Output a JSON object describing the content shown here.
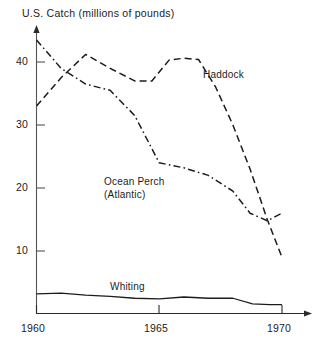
{
  "chart_data": {
    "type": "line",
    "title": "U.S. Catch (millions of pounds)",
    "xlabel": "",
    "ylabel": "U.S. Catch (millions of pounds)",
    "xlim": [
      1960,
      1970
    ],
    "ylim": [
      0,
      45
    ],
    "grid": false,
    "legend_position": "inline-annotations",
    "x_ticks": [
      "1960",
      "1965",
      "1970"
    ],
    "x_tick_values": [
      1960,
      1965,
      1970
    ],
    "y_ticks": [
      "10",
      "20",
      "30",
      "40"
    ],
    "y_tick_values": [
      10,
      20,
      30,
      40
    ],
    "series": [
      {
        "name": "Haddock",
        "style": "dashed",
        "color": "#1c1c1c",
        "x": [
          1960,
          1961,
          1962,
          1963,
          1964,
          1964.7,
          1965.4,
          1966,
          1966.6,
          1967.3,
          1968,
          1968.7,
          1969.4,
          1970
        ],
        "values": [
          33.0,
          37.5,
          41.2,
          39.0,
          37.0,
          37.0,
          40.3,
          40.6,
          40.4,
          36.0,
          30.0,
          23.0,
          15.0,
          9.0
        ]
      },
      {
        "name": "Ocean Perch (Atlantic)",
        "style": "dash-dot",
        "color": "#1c1c1c",
        "x": [
          1960,
          1961,
          1962,
          1963,
          1964,
          1965,
          1966,
          1967,
          1968,
          1968.7,
          1969.4,
          1970
        ],
        "values": [
          43.5,
          39.0,
          36.5,
          35.5,
          31.5,
          24.0,
          23.2,
          22.0,
          19.5,
          16.0,
          14.8,
          16.0
        ]
      },
      {
        "name": "Whiting",
        "style": "solid",
        "color": "#1c1c1c",
        "x": [
          1960,
          1961,
          1962,
          1963,
          1964,
          1965,
          1966,
          1967,
          1968,
          1968.8,
          1969.5,
          1970
        ],
        "values": [
          3.2,
          3.3,
          3.0,
          2.8,
          2.5,
          2.4,
          2.7,
          2.5,
          2.5,
          1.6,
          1.5,
          1.5
        ]
      }
    ],
    "annotations": [
      {
        "text": "Haddock",
        "x": 1966.9,
        "y": 39.5
      },
      {
        "text": "Ocean Perch",
        "x": 1962.8,
        "y": 21.0
      },
      {
        "text": "(Atlantic)",
        "x": 1962.8,
        "y": 19.0
      },
      {
        "text": "Whiting",
        "x": 1963.0,
        "y": 4.2
      }
    ]
  },
  "axes": {
    "y_axis_name": "y-axis",
    "x_axis_name": "x-axis",
    "y_arrow": "up-arrow",
    "x_arrow": "right-arrow"
  }
}
